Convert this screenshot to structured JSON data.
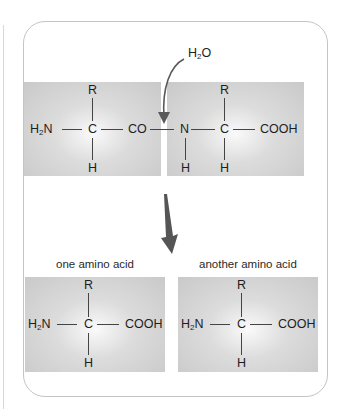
{
  "reaction": {
    "water_label": "H",
    "water_sub": "2",
    "water_tail": "O",
    "dipeptide_left": {
      "top": "R",
      "left_main": "H",
      "left_sub": "2",
      "left_tail": "N",
      "center": "C",
      "right": "CO",
      "bottom": "H"
    },
    "dipeptide_right": {
      "top": "R",
      "left": "N",
      "left_bottom": "H",
      "center": "C",
      "right": "COOH",
      "bottom": "H"
    }
  },
  "products": [
    {
      "caption": "one amino acid",
      "top": "R",
      "left_main": "H",
      "left_sub": "2",
      "left_tail": "N",
      "center": "C",
      "right": "COOH",
      "bottom": "H"
    },
    {
      "caption": "another amino acid",
      "top": "R",
      "left_main": "H",
      "left_sub": "2",
      "left_tail": "N",
      "center": "C",
      "right": "COOH",
      "bottom": "H"
    }
  ],
  "colors": {
    "arrow": "#5a5a5a",
    "box_fill": "#cccccc",
    "panel_border": "#c4c4c4"
  },
  "icons": {
    "curved_arrow": "curved-arrow-icon",
    "down_arrow": "down-arrow-icon"
  }
}
